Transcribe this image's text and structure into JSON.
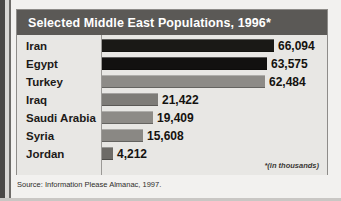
{
  "chart_data": {
    "type": "bar",
    "title": "Selected Middle East Populations, 1996*",
    "orientation": "horizontal",
    "categories": [
      "Iran",
      "Egypt",
      "Turkey",
      "Iraq",
      "Saudi Arabia",
      "Syria",
      "Jordan"
    ],
    "values": [
      66094,
      63575,
      62484,
      21422,
      19409,
      15608,
      4212
    ],
    "value_labels": [
      "66,094",
      "63,575",
      "62,484",
      "21,422",
      "19,409",
      "15,608",
      "4,212"
    ],
    "bar_colors": [
      "#1a1916",
      "#121110",
      "#8d8b87",
      "#7e7c78",
      "#8d8b87",
      "#8a8884",
      "#6d6b67"
    ],
    "xlabel": "",
    "ylabel": "",
    "xlim": [
      0,
      66094
    ],
    "grid": false,
    "legend": null,
    "units_note": "*(in thousands)"
  },
  "chart": {
    "title": "Selected Middle East Populations, 1996*",
    "footnote": "*(in thousands)",
    "source": "Source: Information Please Almanac, 1997."
  },
  "colors": {
    "title_bar": "#5b5956",
    "panel": "#e8e7e4",
    "page": "#f2f1ef",
    "border": "#8e8c89",
    "text": "#1c1a18"
  }
}
